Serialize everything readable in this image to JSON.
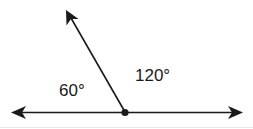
{
  "diagram": {
    "type": "angles-on-a-straight-line",
    "stroke_color": "#1a1a1a",
    "angles": [
      {
        "label": "60°",
        "value": 60,
        "position": "left"
      },
      {
        "label": "120°",
        "value": 120,
        "position": "right"
      }
    ],
    "vertex": {
      "x": 125,
      "y": 112
    },
    "rays": [
      {
        "name": "left-ray",
        "tip": {
          "x": 12,
          "y": 113
        }
      },
      {
        "name": "right-ray",
        "tip": {
          "x": 241,
          "y": 113
        }
      },
      {
        "name": "upper-ray",
        "tip": {
          "x": 67,
          "y": 11
        }
      }
    ]
  }
}
